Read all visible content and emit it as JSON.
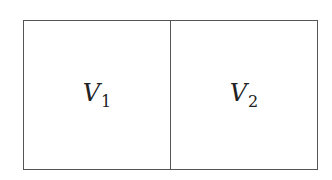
{
  "diagram": {
    "type": "partition",
    "regions": [
      {
        "symbol": "V",
        "subscript": "1"
      },
      {
        "symbol": "V",
        "subscript": "2"
      }
    ],
    "colors": {
      "stroke": "#555555",
      "text": "#222222",
      "background": "#ffffff"
    }
  }
}
